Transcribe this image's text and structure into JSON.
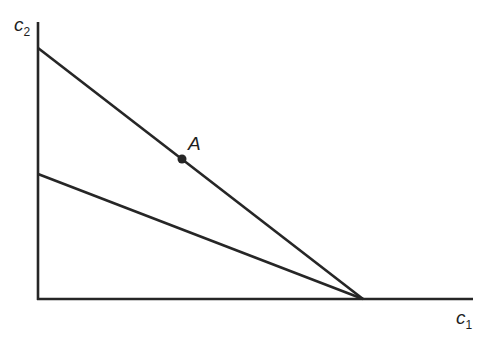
{
  "diagram": {
    "axes": {
      "x_label": "c",
      "x_sub": "1",
      "y_label": "c",
      "y_sub": "2"
    },
    "lines": [
      {
        "name": "budget-line-upper",
        "from": [
          38,
          48
        ],
        "to": [
          363,
          299
        ]
      },
      {
        "name": "budget-line-lower",
        "from": [
          38,
          174
        ],
        "to": [
          363,
          299
        ]
      }
    ],
    "point": {
      "label": "A",
      "x": 182,
      "y": 159
    },
    "colors": {
      "stroke": "#262626",
      "background": "#ffffff"
    }
  }
}
